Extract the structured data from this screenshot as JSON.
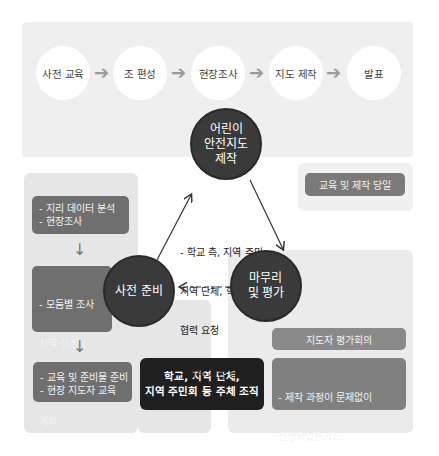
{
  "process_steps": [
    {
      "label": "사전 교육"
    },
    {
      "label": "조 편성"
    },
    {
      "label": "현장조사"
    },
    {
      "label": "지도 제작"
    },
    {
      "label": "발표"
    }
  ],
  "center": {
    "line1": "어린이",
    "line2": "안전지도",
    "line3": "제작"
  },
  "prep": {
    "label": "사전 준비",
    "boxes": [
      {
        "lines": [
          "- 지리 데이터 분석",
          "- 현장조사"
        ]
      },
      {
        "lines": [
          "- 모둠별 조사",
          "  지역 선정",
          "- 제작 일정",
          "  계획"
        ]
      },
      {
        "lines": [
          "- 교육 및 준비물 준비",
          "- 현장 지도자 교육"
        ]
      }
    ]
  },
  "finish": {
    "label_line1": "마무리",
    "label_line2": "및 평가",
    "meeting_label": "지도자 평가회의",
    "questions": [
      "- 제작 과정이 문제없이",
      "  진행되었는가?",
      "- 어떤 점을 개선해야 하는가?"
    ]
  },
  "day_of": {
    "label": "교육 및 제작 당일"
  },
  "notes": {
    "lines": [
      "- 학교 측, 지역 주민,",
      "  지역 단체, 학부모",
      "  협력 요청"
    ],
    "promo": "- 제작 과정 홍보"
  },
  "organizer": {
    "line1": "학교, 지역 단체,",
    "line2": "지역 주민회 등 주체 조직"
  },
  "colors": {
    "band": "#efefef",
    "panel": "#e6e6e6",
    "dark_circle": "#3a3a3a",
    "grey_box": "#6f6f6f",
    "black_box": "#1f1f1f"
  }
}
